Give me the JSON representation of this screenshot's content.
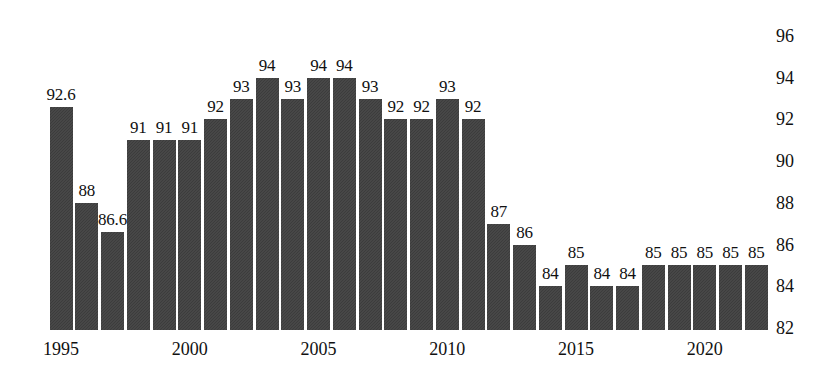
{
  "chart_data": {
    "type": "bar",
    "title": "",
    "subtitle": "",
    "xlabel": "",
    "ylabel": "",
    "grid": false,
    "legend": false,
    "legend_position": "none",
    "ylim": [
      82,
      96
    ],
    "y_ticks": [
      "96",
      "94",
      "92",
      "90",
      "88",
      "86",
      "84",
      "82"
    ],
    "y_tick_values": [
      96,
      94,
      92,
      90,
      88,
      86,
      84,
      82
    ],
    "x_tick_labels": [
      "1995",
      "2000",
      "2005",
      "2010",
      "2015",
      "2020"
    ],
    "x_tick_years": [
      1995,
      2000,
      2005,
      2010,
      2015,
      2020
    ],
    "categories": [
      "1995",
      "1996",
      "1997",
      "1998",
      "1999",
      "2000",
      "2001",
      "2002",
      "2003",
      "2004",
      "2005",
      "2006",
      "2007",
      "2008",
      "2009",
      "2010",
      "2011",
      "2012",
      "2013",
      "2014",
      "2015",
      "2016",
      "2017",
      "2018",
      "2019",
      "2020",
      "2021",
      "2022"
    ],
    "values": [
      92.6,
      88,
      86.6,
      91,
      91,
      91,
      92,
      93,
      94,
      93,
      94,
      94,
      93,
      92,
      92,
      93,
      92,
      87,
      86,
      84,
      85,
      84,
      84,
      85,
      85,
      85,
      85,
      85
    ],
    "data_labels": [
      "92.6",
      "88",
      "86.6",
      "91",
      "91",
      "91",
      "92",
      "93",
      "94",
      "93",
      "94",
      "94",
      "93",
      "92",
      "92",
      "93",
      "92",
      "87",
      "86",
      "84",
      "85",
      "84",
      "84",
      "85",
      "85",
      "85",
      "85",
      "85"
    ],
    "bar_color": "#3f3f3f",
    "background_color": "#ffffff",
    "text_color": "#111111"
  }
}
